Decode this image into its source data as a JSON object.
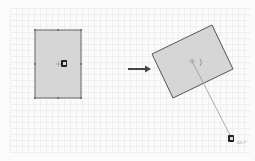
{
  "scene": {
    "before": {
      "shape": "rectangle",
      "x": 35,
      "y": 30,
      "width": 46,
      "height": 68,
      "fill": "#d6d6d6",
      "stroke": "#666666",
      "handles": "8 selection handles",
      "cursor": "rotate-cursor-icon"
    },
    "arrow": {
      "from_x": 128,
      "to_x": 150,
      "y": 69,
      "color": "#444444"
    },
    "after": {
      "shape": "rectangle",
      "corners": [
        [
          152,
          54
        ],
        [
          212,
          25
        ],
        [
          233,
          69
        ],
        [
          173,
          98
        ]
      ],
      "center": [
        192,
        61
      ],
      "fill": "#d6d6d6",
      "stroke": "#555555",
      "rotation_line_end": [
        231,
        139
      ],
      "cursor": "rotate-cursor-icon"
    },
    "angle_label": "-64.7°"
  }
}
